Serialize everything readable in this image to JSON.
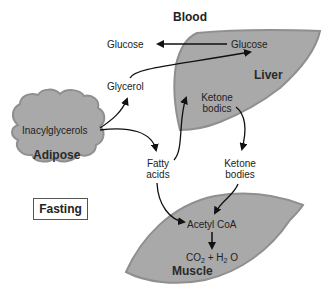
{
  "title": "Blood",
  "condition_label": "Fasting",
  "organs": {
    "liver": "Liver",
    "adipose": "Adipose",
    "muscle": "Muscle"
  },
  "metabolites": {
    "blood_glucose": "Glucose",
    "liver_glucose": "Glucose",
    "glycerol": "Glycerol",
    "triacylglycerols": "Inacylglycerols",
    "liver_ketone_line1": "Ketone",
    "liver_ketone_line2": "bodics",
    "fatty_acids_line1": "Fatty",
    "fatty_acids_line2": "acids",
    "blood_ketone_line1": "Ketone",
    "blood_ketone_line2": "bodies",
    "acetyl_coa": "Acetyl CoA",
    "co2_prefix": "CO",
    "co2_sub": "2",
    "plus": " + ",
    "h2o_prefix": "H",
    "h2o_sub": "2",
    "h2o_suffix": " O"
  },
  "colors": {
    "organ_fill": "#a9a9a9",
    "organ_stroke": "#8a8a8a",
    "arrow": "#111111"
  }
}
